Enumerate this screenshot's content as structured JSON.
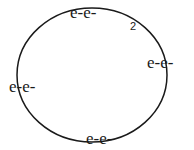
{
  "diagram": {
    "shell": {
      "shape": "ellipse",
      "cx": 92,
      "cy": 75,
      "rx": 75,
      "ry": 67,
      "stroke": "#1a1a1a"
    },
    "electron_pairs": [
      {
        "label": "e-e-",
        "x": 70,
        "y": 18,
        "position": "top"
      },
      {
        "label": "e-e-",
        "x": 147,
        "y": 68,
        "position": "right"
      },
      {
        "label": "e-e-",
        "x": 9,
        "y": 92,
        "position": "left"
      },
      {
        "label": "e-e-",
        "x": 86,
        "y": 144,
        "position": "bottom"
      }
    ],
    "annotation": {
      "label": "2",
      "x": 130,
      "y": 30
    }
  }
}
